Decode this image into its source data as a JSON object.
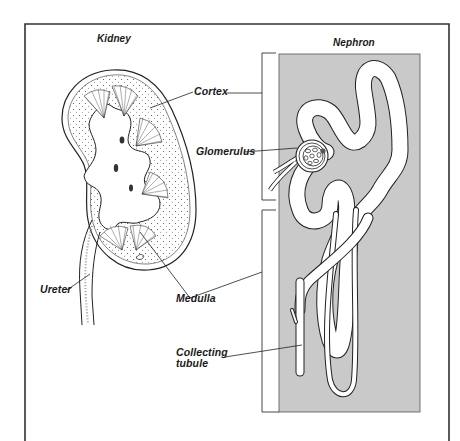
{
  "figure": {
    "panels": [
      {
        "id": "kidney",
        "title": "Kidney"
      },
      {
        "id": "nephron",
        "title": "Nephron"
      }
    ],
    "labels": {
      "cortex": "Cortex",
      "glomerulus": "Glomerulus",
      "ureter": "Ureter",
      "medulla": "Medulla",
      "collecting_tubule_line1": "Collecting",
      "collecting_tubule_line2": "tubule"
    },
    "colors": {
      "frame": "#333333",
      "nephron_panel_bg": "#c9c9c9",
      "line": "#2a2a2a",
      "tubule_fill": "#ffffff"
    }
  }
}
